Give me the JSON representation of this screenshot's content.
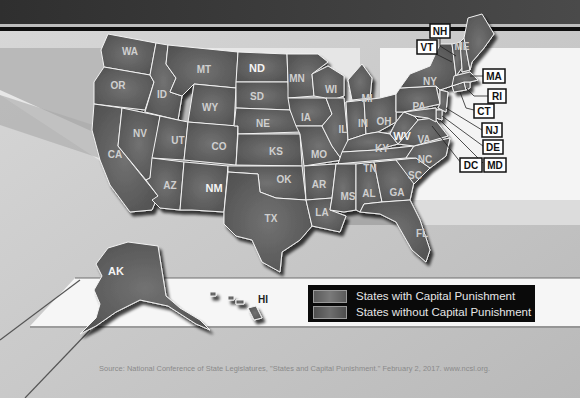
{
  "map": {
    "title": "States with and without Capital Punishment",
    "colors": {
      "with_capital_punishment": "#5a5a5a",
      "without_capital_punishment": "#4a4a4a",
      "top_band": "#3c3c3c",
      "state_border": "#f2f2f2",
      "legend_bg": "#0a0a0a"
    },
    "states": {
      "WA": {
        "label": "WA",
        "capital_punishment": true
      },
      "OR": {
        "label": "OR",
        "capital_punishment": true
      },
      "CA": {
        "label": "CA",
        "capital_punishment": true
      },
      "ID": {
        "label": "ID",
        "capital_punishment": true
      },
      "NV": {
        "label": "NV",
        "capital_punishment": true
      },
      "MT": {
        "label": "MT",
        "capital_punishment": true
      },
      "WY": {
        "label": "WY",
        "capital_punishment": true
      },
      "UT": {
        "label": "UT",
        "capital_punishment": true
      },
      "CO": {
        "label": "CO",
        "capital_punishment": true
      },
      "AZ": {
        "label": "AZ",
        "capital_punishment": true
      },
      "NM": {
        "label": "NM",
        "capital_punishment": false
      },
      "ND": {
        "label": "ND",
        "capital_punishment": false
      },
      "SD": {
        "label": "SD",
        "capital_punishment": true
      },
      "NE": {
        "label": "NE",
        "capital_punishment": true
      },
      "KS": {
        "label": "KS",
        "capital_punishment": true
      },
      "OK": {
        "label": "OK",
        "capital_punishment": true
      },
      "TX": {
        "label": "TX",
        "capital_punishment": true
      },
      "MN": {
        "label": "MN",
        "capital_punishment": false
      },
      "IA": {
        "label": "IA",
        "capital_punishment": false
      },
      "MO": {
        "label": "MO",
        "capital_punishment": true
      },
      "AR": {
        "label": "AR",
        "capital_punishment": true
      },
      "LA": {
        "label": "LA",
        "capital_punishment": true
      },
      "WI": {
        "label": "WI",
        "capital_punishment": false
      },
      "IL": {
        "label": "IL",
        "capital_punishment": false
      },
      "MI": {
        "label": "MI",
        "capital_punishment": false
      },
      "IN": {
        "label": "IN",
        "capital_punishment": true
      },
      "OH": {
        "label": "OH",
        "capital_punishment": true
      },
      "KY": {
        "label": "KY",
        "capital_punishment": true
      },
      "TN": {
        "label": "TN",
        "capital_punishment": true
      },
      "MS": {
        "label": "MS",
        "capital_punishment": true
      },
      "AL": {
        "label": "AL",
        "capital_punishment": true
      },
      "GA": {
        "label": "GA",
        "capital_punishment": true
      },
      "FL": {
        "label": "FL",
        "capital_punishment": true
      },
      "SC": {
        "label": "SC",
        "capital_punishment": true
      },
      "NC": {
        "label": "NC",
        "capital_punishment": true
      },
      "VA": {
        "label": "VA",
        "capital_punishment": true
      },
      "WV": {
        "label": "WV",
        "capital_punishment": false
      },
      "PA": {
        "label": "PA",
        "capital_punishment": true
      },
      "NY": {
        "label": "NY",
        "capital_punishment": false
      },
      "ME": {
        "label": "ME",
        "capital_punishment": false
      },
      "AK": {
        "label": "AK",
        "capital_punishment": false
      },
      "HI": {
        "label": "HI",
        "capital_punishment": false
      }
    },
    "callouts": [
      {
        "label": "NH",
        "capital_punishment": true
      },
      {
        "label": "VT",
        "capital_punishment": false
      },
      {
        "label": "MA",
        "capital_punishment": false
      },
      {
        "label": "RI",
        "capital_punishment": false
      },
      {
        "label": "CT",
        "capital_punishment": false
      },
      {
        "label": "NJ",
        "capital_punishment": false
      },
      {
        "label": "DE",
        "capital_punishment": false
      },
      {
        "label": "MD",
        "capital_punishment": false
      },
      {
        "label": "DC",
        "capital_punishment": false
      }
    ]
  },
  "legend": {
    "items": [
      {
        "label": "States with Capital Punishment",
        "color": "#5e5e5e"
      },
      {
        "label": "States without Capital Punishment",
        "color": "#555555"
      }
    ]
  },
  "source": "Source: National Conference of State Legislatures, \"States and Capital Punishment.\" February 2, 2017. www.ncsl.org."
}
